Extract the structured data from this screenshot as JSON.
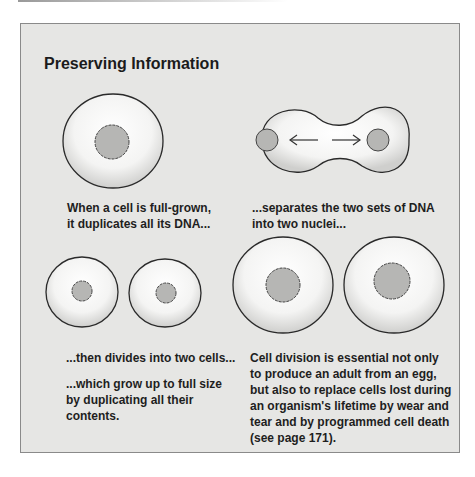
{
  "title": "Preserving Information",
  "captions": {
    "step1": [
      "When a cell is full-grown,",
      "it duplicates all its DNA..."
    ],
    "step2": [
      "...separates the two sets of DNA",
      "into two nuclei..."
    ],
    "step3": [
      "...then divides into two cells..."
    ],
    "step4": [
      "...which grow up to full size",
      "by duplicating all their",
      "contents."
    ],
    "note": [
      "Cell division is essential not only",
      "to produce an adult from an egg,",
      "but also to replace cells lost during",
      "an organism's lifetime by wear and",
      "tear and by programmed cell death",
      "(see page 171)."
    ]
  },
  "colors": {
    "panel": "#e6e6e4",
    "cell": "#f7f7f6",
    "nucleus": "#b5b5b3",
    "outline": "#2a2a2a"
  }
}
